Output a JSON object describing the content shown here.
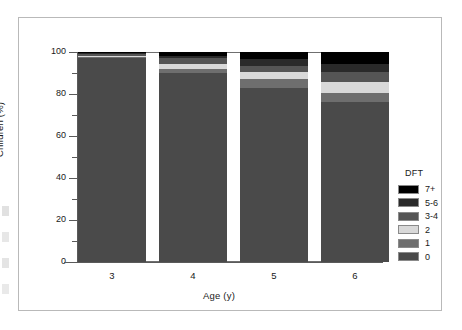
{
  "chart_data": {
    "type": "bar",
    "subtype": "stacked-percentage",
    "title": "",
    "xlabel": "Age (y)",
    "ylabel": "Children (%)",
    "categories": [
      "3",
      "4",
      "5",
      "6"
    ],
    "ylim": [
      0,
      100
    ],
    "yticks": [
      0,
      20,
      40,
      60,
      80,
      100
    ],
    "ytick_labels": [
      "0",
      "20",
      "40",
      "60",
      "80",
      "100"
    ],
    "yminor_ticks": [
      10,
      30,
      50,
      70,
      90
    ],
    "grid": false,
    "legend_title": "DFT",
    "legend_position": "right",
    "stack_order_bottom_to_top": [
      "0",
      "1",
      "2",
      "3-4",
      "5-6",
      "7+"
    ],
    "series": [
      {
        "name": "0",
        "color": "#4a4a4a",
        "values": [
          97.0,
          90.0,
          83.0,
          76.0
        ]
      },
      {
        "name": "1",
        "color": "#6e6e6e",
        "values": [
          0.7,
          2.0,
          4.0,
          4.5
        ]
      },
      {
        "name": "2",
        "color": "#d9d9d9",
        "values": [
          0.6,
          2.5,
          3.5,
          5.0
        ]
      },
      {
        "name": "3-4",
        "color": "#555555",
        "values": [
          0.6,
          2.5,
          3.0,
          5.0
        ]
      },
      {
        "name": "5-6",
        "color": "#2a2a2a",
        "values": [
          0.5,
          1.0,
          3.0,
          4.0
        ]
      },
      {
        "name": "7+",
        "color": "#000000",
        "values": [
          0.6,
          2.0,
          3.5,
          5.5
        ]
      }
    ]
  },
  "legend": {
    "title": "DFT",
    "entries": [
      {
        "label": "7+",
        "color": "#000000"
      },
      {
        "label": "5-6",
        "color": "#2a2a2a"
      },
      {
        "label": "3-4",
        "color": "#555555"
      },
      {
        "label": "2",
        "color": "#d9d9d9"
      },
      {
        "label": "1",
        "color": "#6e6e6e"
      },
      {
        "label": "0",
        "color": "#4a4a4a"
      }
    ]
  }
}
